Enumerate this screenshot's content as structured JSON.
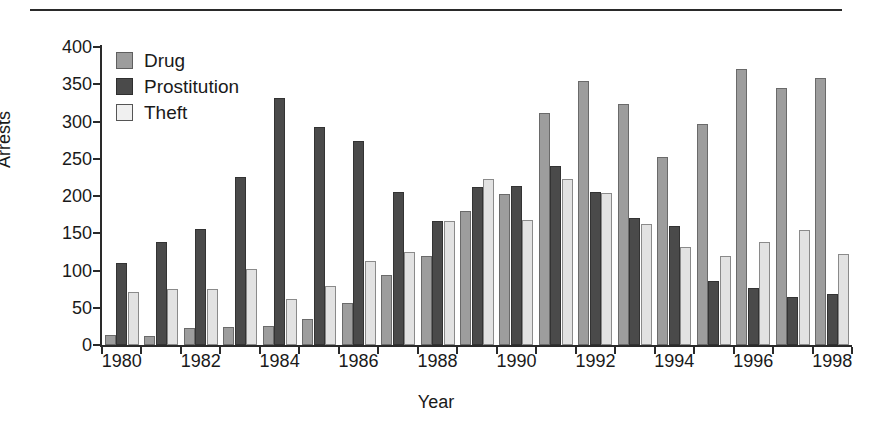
{
  "chart_data": {
    "type": "bar",
    "title": "",
    "xlabel": "Year",
    "ylabel": "Arrests",
    "ylim": [
      0,
      400
    ],
    "yticks": [
      0,
      50,
      100,
      150,
      200,
      250,
      300,
      350,
      400
    ],
    "grid": false,
    "legend_position": "top-left",
    "categories": [
      "1980",
      "1981",
      "1982",
      "1983",
      "1984",
      "1985",
      "1986",
      "1987",
      "1988",
      "1989",
      "1990",
      "1991",
      "1992",
      "1993",
      "1994",
      "1995",
      "1996",
      "1997",
      "1998"
    ],
    "xtick_labels": [
      "1980",
      "1982",
      "1984",
      "1986",
      "1988",
      "1990",
      "1992",
      "1994",
      "1996",
      "1998"
    ],
    "series": [
      {
        "name": "Drug",
        "color": "#9d9d9d",
        "values": [
          13,
          12,
          23,
          24,
          26,
          35,
          56,
          94,
          119,
          180,
          203,
          311,
          355,
          324,
          252,
          296,
          371,
          345,
          358
        ]
      },
      {
        "name": "Prostitution",
        "color": "#4a4a4a",
        "values": [
          110,
          138,
          156,
          225,
          331,
          292,
          274,
          206,
          166,
          212,
          214,
          240,
          205,
          171,
          160,
          86,
          77,
          64,
          68
        ]
      },
      {
        "name": "Theft",
        "color": "#e2e2e2",
        "values": [
          71,
          75,
          75,
          102,
          62,
          79,
          113,
          125,
          167,
          223,
          168,
          223,
          204,
          163,
          131,
          119,
          138,
          154,
          122
        ]
      }
    ]
  },
  "legend": {
    "items": [
      {
        "label": "Drug"
      },
      {
        "label": "Prostitution"
      },
      {
        "label": "Theft"
      }
    ]
  }
}
